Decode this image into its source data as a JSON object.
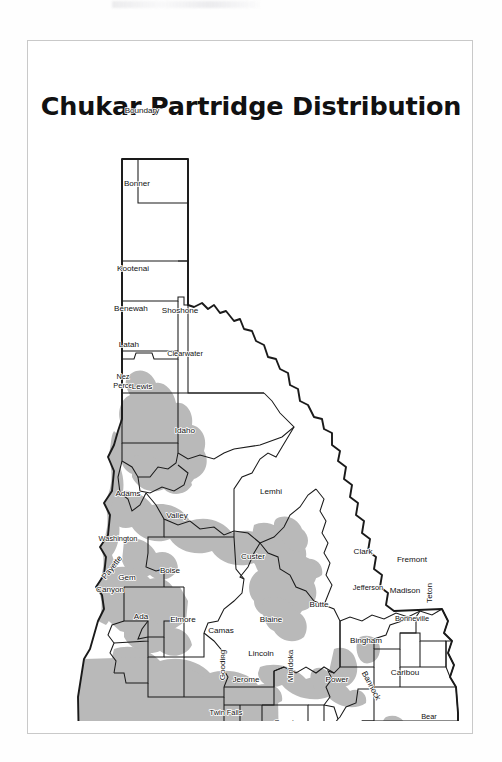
{
  "page": {
    "title": "Chukar Partridge Distribution",
    "top_partial_text": "",
    "frame_border_color": "#c9c9c9"
  },
  "map": {
    "name": "idaho-county-map",
    "state": "Idaho",
    "legend": {
      "shaded_meaning": "Chukar Partridge distribution",
      "shade_color": "#b9b9b9",
      "county_fill": "#ffffff",
      "border_color": "#1a1a1a"
    },
    "counties": [
      {
        "name": "Boundary",
        "x": 137,
        "y": 72,
        "rot": 0,
        "two_line": false
      },
      {
        "name": "Bonner",
        "x": 132,
        "y": 145,
        "rot": 0,
        "two_line": false
      },
      {
        "name": "Kootenai",
        "x": 128,
        "y": 230,
        "rot": 0,
        "two_line": false
      },
      {
        "name": "Benewah",
        "x": 126,
        "y": 270,
        "rot": 0,
        "two_line": false
      },
      {
        "name": "Shoshone",
        "x": 175,
        "y": 272,
        "rot": 0,
        "two_line": false
      },
      {
        "name": "Latah",
        "x": 124,
        "y": 306,
        "rot": 0,
        "two_line": false
      },
      {
        "name": "Clearwater",
        "x": 180,
        "y": 315,
        "rot": 0,
        "two_line": false
      },
      {
        "name": "Nez Perce",
        "x": 118,
        "y": 338,
        "rot": 0,
        "two_line": true
      },
      {
        "name": "Lewis",
        "x": 137,
        "y": 348,
        "rot": 0,
        "two_line": false
      },
      {
        "name": "Idaho",
        "x": 180,
        "y": 392,
        "rot": 0,
        "two_line": false
      },
      {
        "name": "Adams",
        "x": 123,
        "y": 455,
        "rot": 0,
        "two_line": false
      },
      {
        "name": "Valley",
        "x": 172,
        "y": 477,
        "rot": 0,
        "two_line": false
      },
      {
        "name": "Lemhi",
        "x": 266,
        "y": 453,
        "rot": 0,
        "two_line": false
      },
      {
        "name": "Washington",
        "x": 113,
        "y": 500,
        "rot": 0,
        "two_line": false
      },
      {
        "name": "Custer",
        "x": 248,
        "y": 518,
        "rot": 0,
        "two_line": false
      },
      {
        "name": "Clark",
        "x": 358,
        "y": 513,
        "rot": 0,
        "two_line": false
      },
      {
        "name": "Fremont",
        "x": 407,
        "y": 521,
        "rot": 0,
        "two_line": false
      },
      {
        "name": "Payette",
        "x": 109,
        "y": 528,
        "rot": -52,
        "two_line": false
      },
      {
        "name": "Gem",
        "x": 122,
        "y": 539,
        "rot": 0,
        "two_line": false
      },
      {
        "name": "Boise",
        "x": 165,
        "y": 532,
        "rot": 0,
        "two_line": false
      },
      {
        "name": "Jefferson",
        "x": 363,
        "y": 549,
        "rot": 0,
        "two_line": false
      },
      {
        "name": "Madison",
        "x": 400,
        "y": 552,
        "rot": 0,
        "two_line": false
      },
      {
        "name": "Teton",
        "x": 427,
        "y": 552,
        "rot": -90,
        "two_line": false
      },
      {
        "name": "Canyon",
        "x": 105,
        "y": 551,
        "rot": 0,
        "two_line": false
      },
      {
        "name": "Ada",
        "x": 136,
        "y": 578,
        "rot": 0,
        "two_line": false
      },
      {
        "name": "Elmore",
        "x": 178,
        "y": 581,
        "rot": 0,
        "two_line": false
      },
      {
        "name": "Blaine",
        "x": 266,
        "y": 581,
        "rot": 0,
        "two_line": false
      },
      {
        "name": "Butte",
        "x": 314,
        "y": 566,
        "rot": 0,
        "two_line": false
      },
      {
        "name": "Bonneville",
        "x": 407,
        "y": 580,
        "rot": 0,
        "two_line": false
      },
      {
        "name": "Camas",
        "x": 216,
        "y": 592,
        "rot": 0,
        "two_line": false
      },
      {
        "name": "Bingham",
        "x": 361,
        "y": 602,
        "rot": 0,
        "two_line": false
      },
      {
        "name": "Gooding",
        "x": 220,
        "y": 624,
        "rot": -90,
        "two_line": false
      },
      {
        "name": "Lincoln",
        "x": 256,
        "y": 615,
        "rot": 0,
        "two_line": false
      },
      {
        "name": "Minidoka",
        "x": 288,
        "y": 625,
        "rot": -90,
        "two_line": false
      },
      {
        "name": "Power",
        "x": 332,
        "y": 641,
        "rot": 0,
        "two_line": false
      },
      {
        "name": "Caribou",
        "x": 400,
        "y": 634,
        "rot": 0,
        "two_line": false
      },
      {
        "name": "Bannock",
        "x": 364,
        "y": 646,
        "rot": 62,
        "two_line": false
      },
      {
        "name": "Jerome",
        "x": 241,
        "y": 641,
        "rot": 0,
        "two_line": false
      },
      {
        "name": "Twin Falls",
        "x": 221,
        "y": 674,
        "rot": 0,
        "two_line": false
      },
      {
        "name": "Cassia",
        "x": 281,
        "y": 684,
        "rot": 0,
        "two_line": false
      },
      {
        "name": "Oneida",
        "x": 344,
        "y": 686,
        "rot": 0,
        "two_line": false
      },
      {
        "name": "Bear Lake",
        "x": 424,
        "y": 678,
        "rot": 0,
        "two_line": true
      },
      {
        "name": "Franklin",
        "x": 390,
        "y": 697,
        "rot": 0,
        "two_line": false
      }
    ]
  }
}
